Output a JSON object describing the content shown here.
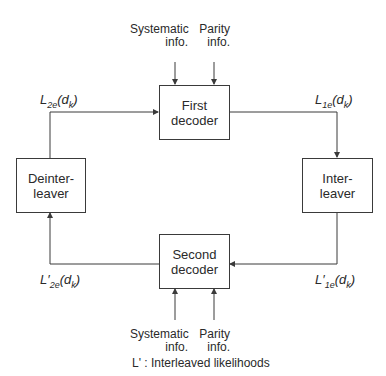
{
  "diagram": {
    "blocks": {
      "first_decoder": "First decoder",
      "second_decoder": "Second decoder",
      "interleaver": "Inter- leaver",
      "deinterleaver": "Deinter- leaver"
    },
    "inputs_top": {
      "systematic": "Systematic info.",
      "parity": "Parity info."
    },
    "inputs_bottom": {
      "systematic": "Systematic info.",
      "parity": "Parity info."
    },
    "signals": {
      "l2e": "L2e(dk)",
      "l1e": "L1e(dk)",
      "lp2e": "L'2e(dk)",
      "lp1e": "L'1e(dk)"
    },
    "note": "L' : Interleaved likelihoods",
    "stroke_color": "#3a3a3a"
  }
}
